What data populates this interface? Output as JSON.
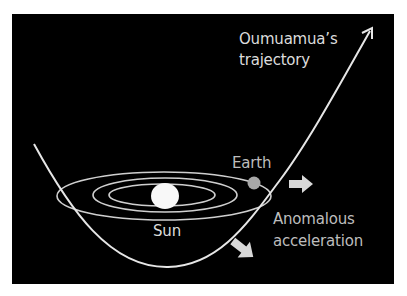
{
  "diagram": {
    "labels": {
      "trajectory_line1": "Oumuamua’s",
      "trajectory_line2": "trajectory",
      "earth": "Earth",
      "sun": "Sun",
      "anomalous_line1": "Anomalous",
      "anomalous_line2": "acceleration"
    },
    "colors": {
      "background": "#000000",
      "frame": "#ffffff",
      "orbit_line": "#cfcfcf",
      "trajectory_line": "#e6e6e6",
      "sun": "#f8f8f8",
      "earth": "#a8a8a8",
      "arrows": "#d8d8d8",
      "text": "#dcdcdc"
    }
  }
}
